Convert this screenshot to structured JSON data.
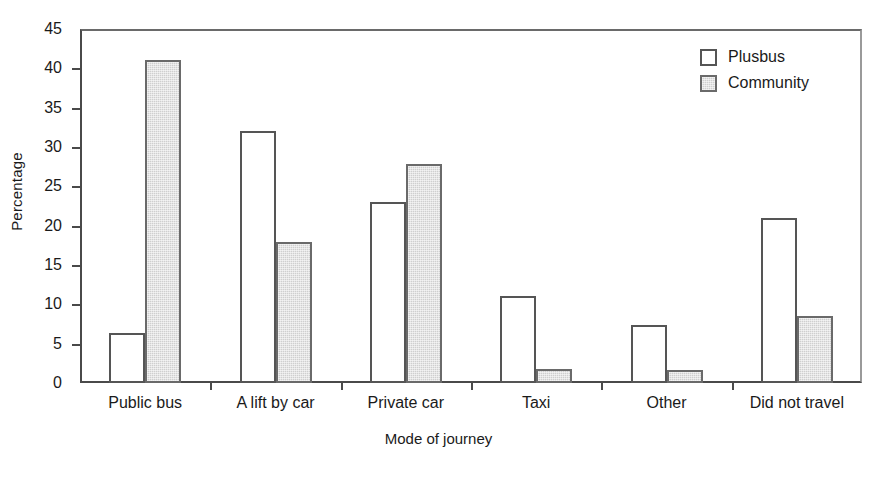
{
  "chart_data": {
    "type": "bar",
    "title": "",
    "subtitle": "",
    "xlabel": "Mode of journey",
    "ylabel": "Percentage",
    "categories": [
      "Public bus",
      "A lift by car",
      "Private car",
      "Taxi",
      "Other",
      "Did not travel"
    ],
    "series": [
      {
        "name": "Plusbus",
        "color": "#ffffff",
        "values": [
          6.3,
          32.0,
          23.0,
          11.0,
          7.4,
          21.0
        ]
      },
      {
        "name": "Community",
        "color": "#cfcfcf",
        "values": [
          41.0,
          17.9,
          27.8,
          1.8,
          1.7,
          8.5
        ]
      }
    ],
    "ylim": [
      0,
      45
    ],
    "ytick_step": 5,
    "yticks": [
      "0",
      "5",
      "10",
      "15",
      "20",
      "25",
      "30",
      "35",
      "40",
      "45"
    ],
    "grid": false,
    "legend_position": "top-right",
    "axis_color": "#4a4a4a",
    "bar_edge_color": "#555555"
  },
  "legend": {
    "entries": [
      {
        "label": "Plusbus"
      },
      {
        "label": "Community"
      }
    ]
  }
}
